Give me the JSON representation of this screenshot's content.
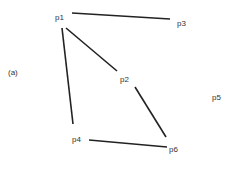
{
  "diagram": {
    "panel_label": "(a)",
    "nodes": [
      {
        "id": "p1",
        "label": "p1",
        "x": 55,
        "y": 14
      },
      {
        "id": "p2",
        "label": "p2",
        "x": 120,
        "y": 76
      },
      {
        "id": "p3",
        "label": "p3",
        "x": 177,
        "y": 20
      },
      {
        "id": "p4",
        "label": "p4",
        "x": 72,
        "y": 136
      },
      {
        "id": "p5",
        "label": "p5",
        "x": 212,
        "y": 94
      },
      {
        "id": "p6",
        "label": "p6",
        "x": 169,
        "y": 146
      }
    ],
    "edges": [
      {
        "from": "p1",
        "to": "p3",
        "x1": 72,
        "y1": 13,
        "x2": 170,
        "y2": 19
      },
      {
        "from": "p1",
        "to": "p4",
        "x1": 62,
        "y1": 28,
        "x2": 73,
        "y2": 124
      },
      {
        "from": "p1",
        "to": "p2",
        "x1": 66,
        "y1": 28,
        "x2": 117,
        "y2": 71
      },
      {
        "from": "p2",
        "to": "p6",
        "x1": 135,
        "y1": 87,
        "x2": 166,
        "y2": 137
      },
      {
        "from": "p4",
        "to": "p6",
        "x1": 89,
        "y1": 140,
        "x2": 167,
        "y2": 147
      }
    ],
    "edge_color": "#222222",
    "label_color": "#333333"
  }
}
